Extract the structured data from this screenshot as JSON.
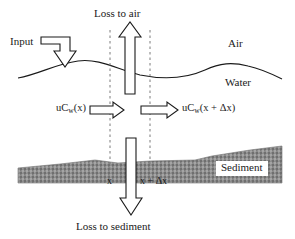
{
  "figure": {
    "kind": "schematic-diagram",
    "width": 295,
    "height": 239,
    "background_color": "#ffffff"
  },
  "labels": {
    "loss_to_air": "Loss to air",
    "input": "Input",
    "air": "Air",
    "water": "Water",
    "sediment": "Sediment",
    "loss_to_sediment": "Loss to sediment",
    "flux_in_prefix": "uC",
    "flux_in_subscript": "w",
    "flux_in_argument": "(x)",
    "flux_out_prefix": "uC",
    "flux_out_subscript": "w",
    "flux_out_argument": "(x + Δx)",
    "boundary_left": "x",
    "boundary_right": "x + Δx"
  },
  "colors": {
    "line": "#1a1a1a",
    "text": "#1a1a1a",
    "sediment_fill": "#8c8c8c",
    "sediment_stipple_dark": "#6b6b6b",
    "sediment_stipple_light": "#a8a8a8",
    "dashed_line": "#7a7a7a",
    "arrow_fill": "#ffffff",
    "background": "#ffffff"
  },
  "geometry": {
    "control_volume_left_x": 110,
    "control_volume_right_x": 150,
    "water_surface_y_mean": 72,
    "sediment_top_y_mean": 160,
    "sediment_bottom_y": 183
  },
  "elements": {
    "input_arrow": "hollow-elbow-arrow-down-into-water",
    "loss_to_air_arrow": "hollow-block-arrow-up-through-water-surface",
    "advection_in_arrow": "hollow-block-arrow-right",
    "advection_out_arrow": "hollow-block-arrow-right",
    "loss_to_sediment_arrow": "hollow-block-arrow-down-through-sediment",
    "water_surface": "wavy-curve",
    "sediment_bed": "stippled-gray-band",
    "control_volume_boundaries": "two-vertical-dashed-lines"
  }
}
